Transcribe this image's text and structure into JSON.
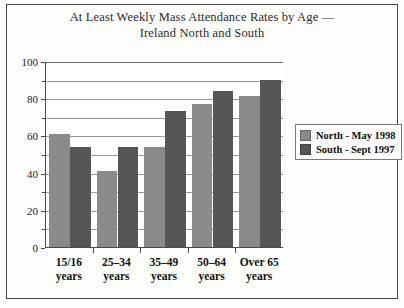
{
  "chart_data": {
    "type": "bar",
    "title": "At Least Weekly Mass Attendance Rates by Age — Ireland North and South",
    "title_line1": "At Least Weekly Mass Attendance Rates by Age —",
    "title_line2": "Ireland North and South",
    "xlabel": "",
    "ylabel": "",
    "ylim": [
      0,
      100
    ],
    "ytick_step": 20,
    "yminor_step": 10,
    "grid": true,
    "grid_axis": "y",
    "legend_position": "right",
    "categories": [
      "15/16 years",
      "25–34 years",
      "35–49 years",
      "50–64 years",
      "Over 65 years"
    ],
    "category_lines": [
      {
        "line1": "15/16",
        "line2": "years"
      },
      {
        "line1": "25–34",
        "line2": "years"
      },
      {
        "line1": "35–49",
        "line2": "years"
      },
      {
        "line1": "50–64",
        "line2": "years"
      },
      {
        "line1": "Over 65",
        "line2": "years"
      }
    ],
    "ytick_labels": [
      "0",
      "20",
      "40",
      "60",
      "80",
      "100"
    ],
    "ytick_values": [
      0,
      20,
      40,
      60,
      80,
      100
    ],
    "series": [
      {
        "name": "North - May 1998",
        "color": "#8a8a8a",
        "values": [
          61,
          41,
          54,
          77,
          81
        ]
      },
      {
        "name": "South - Sept 1997",
        "color": "#565656",
        "values": [
          54,
          54,
          73,
          84,
          90
        ]
      }
    ]
  },
  "legend": {
    "items": [
      {
        "label": "North - May 1998",
        "color": "#8a8a8a"
      },
      {
        "label": "South - Sept 1997",
        "color": "#565656"
      }
    ]
  }
}
